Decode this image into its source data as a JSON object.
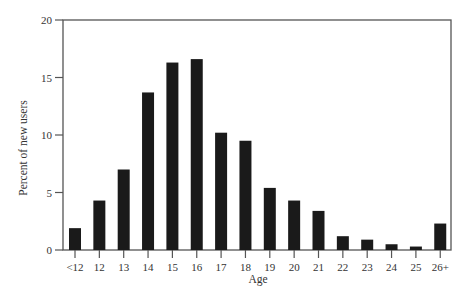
{
  "chart_data": {
    "type": "bar",
    "title": "",
    "xlabel": "Age",
    "ylabel": "Percent of new users",
    "categories": [
      "<12",
      "12",
      "13",
      "14",
      "15",
      "16",
      "17",
      "18",
      "19",
      "20",
      "21",
      "22",
      "23",
      "24",
      "25",
      "26+"
    ],
    "values": [
      1.9,
      4.3,
      7.0,
      13.7,
      16.3,
      16.6,
      10.2,
      9.5,
      5.4,
      4.3,
      3.4,
      1.2,
      0.9,
      0.5,
      0.3,
      2.3
    ],
    "ylim": [
      0,
      20
    ],
    "yticks": [
      0,
      5,
      10,
      15,
      20
    ],
    "grid": false,
    "legend": null,
    "bar_color": "#1a1a1a",
    "frame": "box"
  }
}
